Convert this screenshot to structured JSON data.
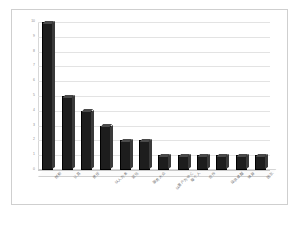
{
  "chart_data": {
    "type": "bar",
    "title": "",
    "subtitle": "",
    "xlabel": "",
    "ylabel": "",
    "ylim": [
      0,
      10
    ],
    "yticks": [
      "0",
      "1",
      "2",
      "3",
      "4",
      "5",
      "6",
      "7",
      "8",
      "9",
      "10"
    ],
    "grid": true,
    "legend": false,
    "legend_position": "none",
    "style": "3d-column",
    "bar_color": "#1d1d1d",
    "grid_color": "#e3e3e3",
    "background": "#ffffff",
    "border_color": "#cfcfcf",
    "categories": [
      "创新",
      "认真",
      "责任",
      "以人为本",
      "诚信",
      "服务大众",
      "以客户为中心",
      "每个人",
      "合作",
      "追求卓越",
      "效益",
      "团队"
    ],
    "values": [
      10,
      5,
      4,
      3,
      2,
      2,
      1,
      1,
      1,
      1,
      1,
      1
    ]
  }
}
